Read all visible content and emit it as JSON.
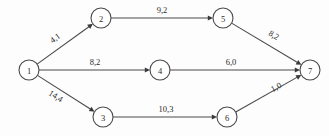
{
  "diagram": {
    "type": "directed-network-graph",
    "background_color": "#fdfdfd",
    "stroke_color": "#4a4a4a",
    "text_color": "#2b2b2b",
    "node_radius": 10,
    "nodes": [
      {
        "id": "1",
        "label": "1",
        "cx": 29,
        "cy": 70
      },
      {
        "id": "2",
        "label": "2",
        "cx": 101,
        "cy": 18
      },
      {
        "id": "3",
        "label": "3",
        "cx": 103,
        "cy": 117
      },
      {
        "id": "4",
        "label": "4",
        "cx": 160,
        "cy": 70
      },
      {
        "id": "5",
        "label": "5",
        "cx": 223,
        "cy": 18
      },
      {
        "id": "6",
        "label": "6",
        "cx": 227,
        "cy": 117
      },
      {
        "id": "7",
        "label": "7",
        "cx": 310,
        "cy": 70
      }
    ],
    "edges": [
      {
        "from": "1",
        "to": "2",
        "label": "4,1",
        "x1": 29,
        "y1": 70,
        "x2": 101,
        "y2": 18,
        "lx": 55,
        "ly": 38,
        "rot": -35.8
      },
      {
        "from": "1",
        "to": "4",
        "label": "8,2",
        "x1": 29,
        "y1": 70,
        "x2": 160,
        "y2": 70,
        "lx": 95,
        "ly": 62,
        "rot": 0
      },
      {
        "from": "1",
        "to": "3",
        "label": "14,4",
        "x1": 29,
        "y1": 70,
        "x2": 103,
        "y2": 117,
        "lx": 56,
        "ly": 96,
        "rot": 32.4
      },
      {
        "from": "2",
        "to": "5",
        "label": "9,2",
        "x1": 101,
        "y1": 18,
        "x2": 223,
        "y2": 18,
        "lx": 162,
        "ly": 10,
        "rot": 0
      },
      {
        "from": "4",
        "to": "7",
        "label": "6,0",
        "x1": 160,
        "y1": 70,
        "x2": 310,
        "y2": 70,
        "lx": 231,
        "ly": 62,
        "rot": 0
      },
      {
        "from": "3",
        "to": "6",
        "label": "10,3",
        "x1": 103,
        "y1": 117,
        "x2": 227,
        "y2": 117,
        "lx": 166,
        "ly": 109,
        "rot": 0
      },
      {
        "from": "5",
        "to": "7",
        "label": "8,2",
        "x1": 223,
        "y1": 18,
        "x2": 310,
        "y2": 70,
        "lx": 274,
        "ly": 35,
        "rot": 30.9
      },
      {
        "from": "6",
        "to": "7",
        "label": "1,0",
        "x1": 227,
        "y1": 117,
        "x2": 310,
        "y2": 70,
        "lx": 276,
        "ly": 87,
        "rot": -29.5
      }
    ]
  }
}
